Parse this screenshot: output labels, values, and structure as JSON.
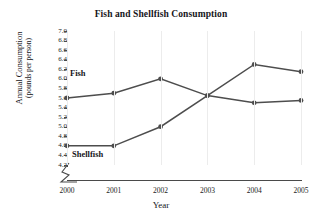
{
  "chart_data": {
    "type": "line",
    "title": "Fish and Shellfish Consumption",
    "xlabel": "Year",
    "ylabel": "Annual Consumption (pounds per person)",
    "ylabel_line1": "Annual Consumption",
    "ylabel_line2": "(pounds per person)",
    "categories": [
      "2000",
      "2001",
      "2002",
      "2003",
      "2004",
      "2005"
    ],
    "x": [
      2000,
      2001,
      2002,
      2003,
      2004,
      2005
    ],
    "series": [
      {
        "name": "Fish",
        "values": [
          5.6,
          5.7,
          6.0,
          5.65,
          5.5,
          5.55
        ]
      },
      {
        "name": "Shellfish",
        "values": [
          4.6,
          4.6,
          5.0,
          5.65,
          6.3,
          6.15
        ]
      }
    ],
    "ylim": [
      4.2,
      7.0
    ],
    "ytick_step": 0.2,
    "yticks": [
      "7.0",
      "6.8",
      "6.6",
      "6.4",
      "6.2",
      "6.0",
      "5.8",
      "5.6",
      "5.4",
      "5.2",
      "5.0",
      "4.8",
      "4.6",
      "4.4",
      "4.2"
    ],
    "grid": "vertical-only",
    "legend": "inline-labels",
    "axis_break": true,
    "line_color": "#4d4d4d",
    "marker_color": "#4d4d4d",
    "grid_color": "#ececec",
    "axis_color": "#4a4a4a",
    "text_color": "#16161a",
    "background": "#ffffff",
    "annotations": [
      {
        "text": "Fish",
        "near_series": "Fish"
      },
      {
        "text": "Shellfish",
        "near_series": "Shellfish"
      }
    ]
  }
}
